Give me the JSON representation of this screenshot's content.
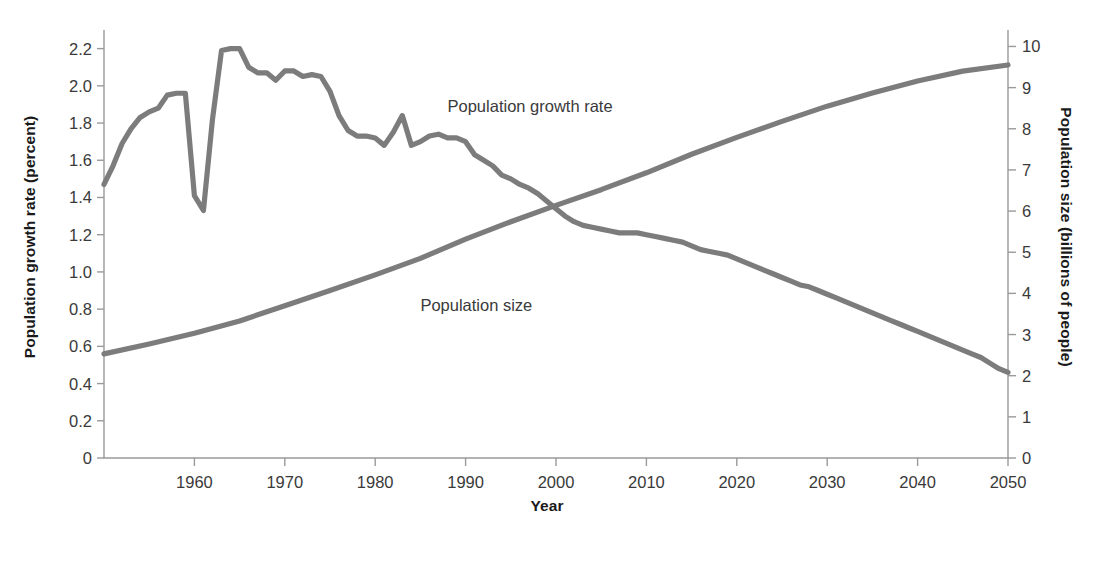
{
  "figure": {
    "background": "#ffffff",
    "line_color": "#7c7c7c",
    "axis_color": "#9a9a9a",
    "text_color": "#3a3a3a"
  },
  "axes": {
    "left_title": "Population growth rate (percent)",
    "right_title": "Population size (billions of people)",
    "x_title": "Year",
    "left_ticks": [
      "0",
      "0.2",
      "0.4",
      "0.6",
      "0.8",
      "1.0",
      "1.2",
      "1.4",
      "1.6",
      "1.8",
      "2.0",
      "2.2"
    ],
    "right_ticks": [
      "0",
      "1",
      "2",
      "3",
      "4",
      "5",
      "6",
      "7",
      "8",
      "9",
      "10"
    ],
    "x_ticks": [
      "1960",
      "1970",
      "1980",
      "1990",
      "2000",
      "2010",
      "2020",
      "2030",
      "2040",
      "2050"
    ]
  },
  "series_labels": {
    "growth_rate": "Population growth rate",
    "population_size": "Population size"
  },
  "chart_data": {
    "type": "line",
    "title": "",
    "xlabel": "Year",
    "ylabel": "Population growth rate (percent)",
    "y2label": "Population size (billions of people)",
    "xlim": [
      1950,
      2050
    ],
    "ylim": [
      0,
      2.3
    ],
    "y2lim": [
      0,
      10.4
    ],
    "grid": false,
    "legend": "inline-annotations",
    "x_tick_values": [
      1960,
      1970,
      1980,
      1990,
      2000,
      2010,
      2020,
      2030,
      2040,
      2050
    ],
    "y_tick_values": [
      0,
      0.2,
      0.4,
      0.6,
      0.8,
      1.0,
      1.2,
      1.4,
      1.6,
      1.8,
      2.0,
      2.2
    ],
    "y2_tick_values": [
      0,
      1,
      2,
      3,
      4,
      5,
      6,
      7,
      8,
      9,
      10
    ],
    "annotations": [
      {
        "text": "Population growth rate",
        "x": 1988,
        "y": 1.86
      },
      {
        "text": "Population size",
        "x": 1985,
        "y": 0.79
      }
    ],
    "series": [
      {
        "name": "Population growth rate",
        "axis": "left",
        "unit": "percent",
        "color": "#7c7c7c",
        "x": [
          1950,
          1951,
          1952,
          1953,
          1954,
          1955,
          1956,
          1957,
          1958,
          1959,
          1960,
          1961,
          1962,
          1963,
          1964,
          1965,
          1966,
          1967,
          1968,
          1969,
          1970,
          1971,
          1972,
          1973,
          1974,
          1975,
          1976,
          1977,
          1978,
          1979,
          1980,
          1981,
          1982,
          1983,
          1984,
          1985,
          1986,
          1987,
          1988,
          1989,
          1990,
          1991,
          1992,
          1993,
          1994,
          1995,
          1996,
          1997,
          1998,
          1999,
          2000,
          2001,
          2002,
          2003,
          2004,
          2005,
          2006,
          2007,
          2008,
          2009,
          2010,
          2011,
          2012,
          2013,
          2014,
          2015,
          2016,
          2017,
          2018,
          2019,
          2020,
          2021,
          2022,
          2023,
          2024,
          2025,
          2026,
          2027,
          2028,
          2029,
          2030,
          2031,
          2032,
          2033,
          2034,
          2035,
          2036,
          2037,
          2038,
          2039,
          2040,
          2041,
          2042,
          2043,
          2044,
          2045,
          2046,
          2047,
          2048,
          2049,
          2050
        ],
        "values": [
          1.47,
          1.57,
          1.69,
          1.77,
          1.83,
          1.86,
          1.88,
          1.95,
          1.96,
          1.96,
          1.41,
          1.33,
          1.82,
          2.19,
          2.2,
          2.2,
          2.1,
          2.07,
          2.07,
          2.03,
          2.08,
          2.08,
          2.05,
          2.06,
          2.05,
          1.97,
          1.84,
          1.76,
          1.73,
          1.73,
          1.72,
          1.68,
          1.75,
          1.84,
          1.68,
          1.7,
          1.73,
          1.74,
          1.72,
          1.72,
          1.7,
          1.63,
          1.6,
          1.57,
          1.52,
          1.5,
          1.47,
          1.45,
          1.42,
          1.38,
          1.34,
          1.3,
          1.27,
          1.25,
          1.24,
          1.23,
          1.22,
          1.21,
          1.21,
          1.21,
          1.2,
          1.19,
          1.18,
          1.17,
          1.16,
          1.14,
          1.12,
          1.11,
          1.1,
          1.09,
          1.07,
          1.05,
          1.03,
          1.01,
          0.99,
          0.97,
          0.95,
          0.93,
          0.92,
          0.9,
          0.88,
          0.86,
          0.84,
          0.82,
          0.8,
          0.78,
          0.76,
          0.74,
          0.72,
          0.7,
          0.68,
          0.66,
          0.64,
          0.62,
          0.6,
          0.58,
          0.56,
          0.54,
          0.51,
          0.48,
          0.46
        ]
      },
      {
        "name": "Population size",
        "axis": "right",
        "unit": "billions of people",
        "color": "#7c7c7c",
        "x": [
          1950,
          1955,
          1960,
          1965,
          1970,
          1975,
          1980,
          1985,
          1990,
          1995,
          2000,
          2005,
          2010,
          2015,
          2020,
          2025,
          2030,
          2035,
          2040,
          2045,
          2050
        ],
        "values": [
          2.53,
          2.77,
          3.03,
          3.33,
          3.7,
          4.07,
          4.45,
          4.85,
          5.32,
          5.74,
          6.14,
          6.52,
          6.93,
          7.38,
          7.79,
          8.18,
          8.55,
          8.87,
          9.16,
          9.4,
          9.55
        ]
      }
    ]
  }
}
